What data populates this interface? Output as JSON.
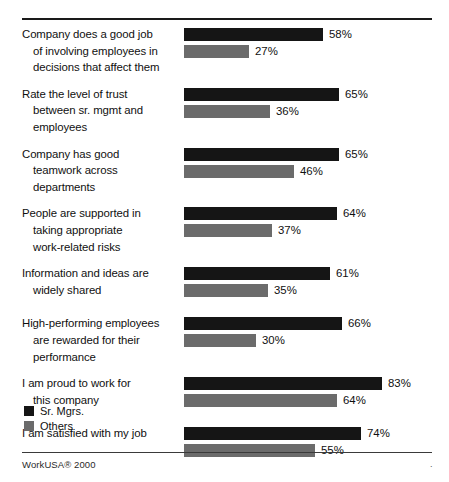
{
  "chart_data": {
    "type": "bar",
    "orientation": "horizontal",
    "title": "",
    "subtitle": "",
    "xlabel": "",
    "ylabel": "",
    "xlim": [
      0,
      100
    ],
    "grid": false,
    "value_suffix": "%",
    "legend_position": "bottom-left",
    "categories": [
      "Company does a good job of involving employees in decisions that affect them",
      "Rate the level of trust between sr. mgmt and employees",
      "Company has good teamwork across departments",
      "People are supported in taking appropriate work-related risks",
      "Information and ideas are widely shared",
      "High-performing employees are rewarded for their performance",
      "I am proud to work for this company",
      "I am satisfied with my job"
    ],
    "series": [
      {
        "name": "Sr. Mgrs.",
        "color": "#151515",
        "values": [
          58,
          65,
          65,
          64,
          61,
          66,
          83,
          74
        ]
      },
      {
        "name": "Others",
        "color": "#6b6b6b",
        "values": [
          27,
          36,
          46,
          37,
          35,
          30,
          64,
          55
        ]
      }
    ]
  },
  "groups": [
    {
      "label_lines": [
        "Company does a good job",
        "of involving employees in",
        "decisions that affect them"
      ],
      "bars": [
        {
          "series": "Sr. Mgrs.",
          "value": 58,
          "value_label": "58%"
        },
        {
          "series": "Others",
          "value": 27,
          "value_label": "27%"
        }
      ]
    },
    {
      "label_lines": [
        "Rate the level of trust",
        "between sr. mgmt and",
        "employees"
      ],
      "bars": [
        {
          "series": "Sr. Mgrs.",
          "value": 65,
          "value_label": "65%"
        },
        {
          "series": "Others",
          "value": 36,
          "value_label": "36%"
        }
      ]
    },
    {
      "label_lines": [
        "Company has good",
        "teamwork across",
        "departments"
      ],
      "bars": [
        {
          "series": "Sr. Mgrs.",
          "value": 65,
          "value_label": "65%"
        },
        {
          "series": "Others",
          "value": 46,
          "value_label": "46%"
        }
      ]
    },
    {
      "label_lines": [
        "People are supported in",
        "taking appropriate",
        "work-related risks"
      ],
      "bars": [
        {
          "series": "Sr. Mgrs.",
          "value": 64,
          "value_label": "64%"
        },
        {
          "series": "Others",
          "value": 37,
          "value_label": "37%"
        }
      ]
    },
    {
      "label_lines": [
        "Information and ideas are",
        "widely shared"
      ],
      "bars": [
        {
          "series": "Sr. Mgrs.",
          "value": 61,
          "value_label": "61%"
        },
        {
          "series": "Others",
          "value": 35,
          "value_label": "35%"
        }
      ]
    },
    {
      "label_lines": [
        "High-performing employees",
        "are rewarded for their",
        "performance"
      ],
      "bars": [
        {
          "series": "Sr. Mgrs.",
          "value": 66,
          "value_label": "66%"
        },
        {
          "series": "Others",
          "value": 30,
          "value_label": "30%"
        }
      ]
    },
    {
      "label_lines": [
        "I am proud to work for",
        "this company"
      ],
      "bars": [
        {
          "series": "Sr. Mgrs.",
          "value": 83,
          "value_label": "83%"
        },
        {
          "series": "Others",
          "value": 64,
          "value_label": "64%"
        }
      ]
    },
    {
      "label_lines": [
        "I am satisfied with my job"
      ],
      "bars": [
        {
          "series": "Sr. Mgrs.",
          "value": 74,
          "value_label": "74%"
        },
        {
          "series": "Others",
          "value": 55,
          "value_label": "55%"
        }
      ]
    }
  ],
  "legend": {
    "items": [
      {
        "label": "Sr. Mgrs.",
        "color": "#151515"
      },
      {
        "label": "Others",
        "color": "#6b6b6b"
      }
    ]
  },
  "footer": {
    "source": "WorkUSA® 2000",
    "corner_mark": "."
  },
  "colors": {
    "sr_mgrs": "#151515",
    "others": "#6b6b6b",
    "rule": "#1a1a1a",
    "background": "#ffffff",
    "text": "#101010"
  },
  "layout": {
    "bar_origin_x": 184,
    "px_per_percent": 2.39,
    "bar_height": 13
  }
}
